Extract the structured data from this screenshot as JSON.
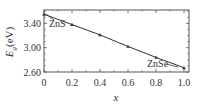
{
  "chart_data": {
    "type": "line",
    "title": "",
    "xlabel": "x",
    "ylabel": "E_g(eV)",
    "ylabel_main": "E",
    "ylabel_sub": "g",
    "ylabel_unit": "(eV)",
    "xlim": [
      0,
      1.0
    ],
    "ylim": [
      2.6,
      3.62
    ],
    "x_ticks": [
      "0",
      "0.2",
      "0.4",
      "0.6",
      "0.8",
      "1.0"
    ],
    "y_ticks": [
      "2.60",
      "3.00",
      "3.40"
    ],
    "grid": false,
    "legend": null,
    "series": [
      {
        "name": "ZnS(1-x)Se(x) band gap",
        "x": [
          0,
          0.2,
          0.4,
          0.6,
          0.8,
          1.0
        ],
        "values": [
          3.55,
          3.38,
          3.21,
          3.02,
          2.84,
          2.67
        ],
        "marker": "triangle"
      }
    ],
    "annotations": [
      {
        "text": "ZnS",
        "points_to": [
          0,
          3.55
        ]
      },
      {
        "text": "ZnSe",
        "points_to": [
          0.95,
          2.69
        ]
      }
    ]
  },
  "colors": {
    "line": "#333333",
    "frame": "#555555",
    "text": "#333333"
  }
}
